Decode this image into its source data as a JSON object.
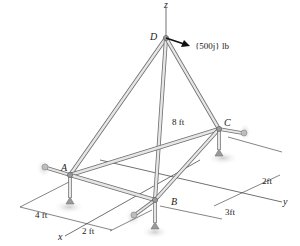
{
  "diagram": {
    "type": "space-truss",
    "joints": {
      "A": {
        "label": "A"
      },
      "B": {
        "label": "B"
      },
      "C": {
        "label": "C"
      },
      "D": {
        "label": "D"
      }
    },
    "axes": {
      "x": "x",
      "y": "y",
      "z": "z"
    },
    "load": {
      "label": "{500j} lb",
      "at": "D"
    },
    "dimensions": {
      "height": "8 ft",
      "ax_offset": "4 ft",
      "bx_offset": "2 ft",
      "by_offset": "3ft",
      "cy_offset": "2ft"
    },
    "members": [
      "AD",
      "BD",
      "CD",
      "AB",
      "BC",
      "AC"
    ],
    "colors": {
      "member_fill": "#e6e6e6",
      "member_edge": "#6f6f6f",
      "support": "#9a9a9a",
      "shadow": "#d8d8d8"
    }
  }
}
